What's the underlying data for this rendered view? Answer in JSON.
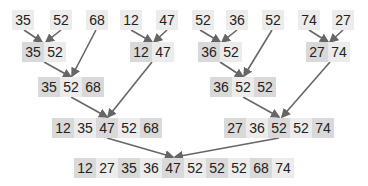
{
  "colors": {
    "cell_dark": "#d9d9d9",
    "cell_light": "#ececec",
    "arrow": "#666666",
    "text": "#222222"
  },
  "levels": [
    {
      "name": "level-1-singletons",
      "groups": [
        {
          "cells": [
            {
              "v": "35",
              "x": 12,
              "w": 22,
              "c": "light"
            }
          ],
          "y": 10
        },
        {
          "cells": [
            {
              "v": "52",
              "x": 50,
              "w": 22,
              "c": "light"
            }
          ],
          "y": 10
        },
        {
          "cells": [
            {
              "v": "68",
              "x": 86,
              "w": 22,
              "c": "light"
            }
          ],
          "y": 10
        },
        {
          "cells": [
            {
              "v": "12",
              "x": 120,
              "w": 22,
              "c": "light"
            }
          ],
          "y": 10
        },
        {
          "cells": [
            {
              "v": "47",
              "x": 156,
              "w": 22,
              "c": "light"
            }
          ],
          "y": 10
        },
        {
          "cells": [
            {
              "v": "52",
              "x": 192,
              "w": 22,
              "c": "light"
            }
          ],
          "y": 10
        },
        {
          "cells": [
            {
              "v": "36",
              "x": 226,
              "w": 22,
              "c": "light"
            }
          ],
          "y": 10
        },
        {
          "cells": [
            {
              "v": "52",
              "x": 262,
              "w": 22,
              "c": "light"
            }
          ],
          "y": 10
        },
        {
          "cells": [
            {
              "v": "74",
              "x": 298,
              "w": 22,
              "c": "light"
            }
          ],
          "y": 10
        },
        {
          "cells": [
            {
              "v": "27",
              "x": 332,
              "w": 22,
              "c": "light"
            }
          ],
          "y": 10
        }
      ]
    },
    {
      "name": "level-2-pairs",
      "groups": [
        {
          "cells": [
            {
              "v": "35",
              "x": 22,
              "w": 22,
              "c": "dark"
            },
            {
              "v": "52",
              "x": 44,
              "w": 22,
              "c": "light"
            }
          ],
          "y": 42
        },
        {
          "cells": [
            {
              "v": "12",
              "x": 130,
              "w": 22,
              "c": "dark"
            },
            {
              "v": "47",
              "x": 152,
              "w": 22,
              "c": "light"
            }
          ],
          "y": 42
        },
        {
          "cells": [
            {
              "v": "36",
              "x": 198,
              "w": 22,
              "c": "dark"
            },
            {
              "v": "52",
              "x": 220,
              "w": 22,
              "c": "light"
            }
          ],
          "y": 42
        },
        {
          "cells": [
            {
              "v": "27",
              "x": 306,
              "w": 22,
              "c": "dark"
            },
            {
              "v": "74",
              "x": 328,
              "w": 22,
              "c": "light"
            }
          ],
          "y": 42
        }
      ]
    },
    {
      "name": "level-3-triples",
      "groups": [
        {
          "cells": [
            {
              "v": "35",
              "x": 38,
              "w": 22,
              "c": "dark"
            },
            {
              "v": "52",
              "x": 60,
              "w": 22,
              "c": "light"
            },
            {
              "v": "68",
              "x": 82,
              "w": 22,
              "c": "dark"
            }
          ],
          "y": 77
        },
        {
          "cells": [
            {
              "v": "36",
              "x": 210,
              "w": 22,
              "c": "dark"
            },
            {
              "v": "52",
              "x": 232,
              "w": 22,
              "c": "light"
            },
            {
              "v": "52",
              "x": 254,
              "w": 22,
              "c": "dark"
            }
          ],
          "y": 77
        }
      ]
    },
    {
      "name": "level-4-halves",
      "groups": [
        {
          "cells": [
            {
              "v": "12",
              "x": 52,
              "w": 22,
              "c": "dark"
            },
            {
              "v": "35",
              "x": 74,
              "w": 22,
              "c": "light"
            },
            {
              "v": "47",
              "x": 96,
              "w": 22,
              "c": "dark"
            },
            {
              "v": "52",
              "x": 118,
              "w": 22,
              "c": "light"
            },
            {
              "v": "68",
              "x": 140,
              "w": 22,
              "c": "dark"
            }
          ],
          "y": 118
        },
        {
          "cells": [
            {
              "v": "27",
              "x": 224,
              "w": 22,
              "c": "dark"
            },
            {
              "v": "36",
              "x": 246,
              "w": 22,
              "c": "light"
            },
            {
              "v": "52",
              "x": 268,
              "w": 22,
              "c": "dark"
            },
            {
              "v": "52",
              "x": 290,
              "w": 22,
              "c": "light"
            },
            {
              "v": "74",
              "x": 312,
              "w": 22,
              "c": "dark"
            }
          ],
          "y": 118
        }
      ]
    },
    {
      "name": "level-5-sorted",
      "groups": [
        {
          "cells": [
            {
              "v": "12",
              "x": 74,
              "w": 22,
              "c": "dark"
            },
            {
              "v": "27",
              "x": 96,
              "w": 22,
              "c": "light"
            },
            {
              "v": "35",
              "x": 118,
              "w": 22,
              "c": "dark"
            },
            {
              "v": "36",
              "x": 140,
              "w": 22,
              "c": "light"
            },
            {
              "v": "47",
              "x": 162,
              "w": 22,
              "c": "dark"
            },
            {
              "v": "52",
              "x": 184,
              "w": 22,
              "c": "light"
            },
            {
              "v": "52",
              "x": 206,
              "w": 22,
              "c": "dark"
            },
            {
              "v": "52",
              "x": 228,
              "w": 22,
              "c": "light"
            },
            {
              "v": "68",
              "x": 250,
              "w": 22,
              "c": "dark"
            },
            {
              "v": "74",
              "x": 272,
              "w": 22,
              "c": "light"
            }
          ],
          "y": 158
        }
      ]
    }
  ],
  "arrows": [
    [
      24,
      30,
      42,
      42
    ],
    [
      61,
      30,
      46,
      42
    ],
    [
      96,
      30,
      72,
      76
    ],
    [
      131,
      30,
      152,
      42
    ],
    [
      167,
      30,
      154,
      42
    ],
    [
      200,
      30,
      220,
      42
    ],
    [
      237,
      30,
      222,
      42
    ],
    [
      272,
      30,
      244,
      76
    ],
    [
      309,
      30,
      328,
      42
    ],
    [
      343,
      30,
      330,
      42
    ],
    [
      44,
      62,
      71,
      77
    ],
    [
      152,
      62,
      108,
      117
    ],
    [
      220,
      62,
      243,
      77
    ],
    [
      330,
      62,
      282,
      117
    ],
    [
      71,
      97,
      107,
      117
    ],
    [
      243,
      97,
      279,
      117
    ],
    [
      107,
      138,
      173,
      157
    ],
    [
      279,
      138,
      175,
      157
    ]
  ]
}
